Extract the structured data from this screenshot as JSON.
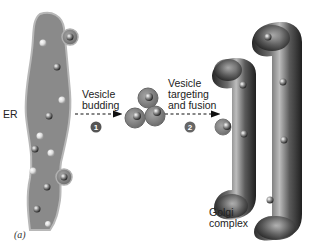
{
  "diagram": {
    "labels": {
      "er": "ER",
      "step1": "Vesicle\nbudding",
      "step2": "Vesicle\ntargeting\nand fusion",
      "golgi": "Golgi\ncomplex"
    },
    "steps": [
      {
        "number": "1"
      },
      {
        "number": "2"
      }
    ],
    "caption": "(a)",
    "colors": {
      "er_fill": "#8a8a8a",
      "er_edge": "#b8b8b8",
      "vesicle_fill": "#8c8c8c",
      "golgi_dark": "#2e2e2e",
      "golgi_light": "#a8a8a8",
      "badge": "#555555"
    }
  }
}
